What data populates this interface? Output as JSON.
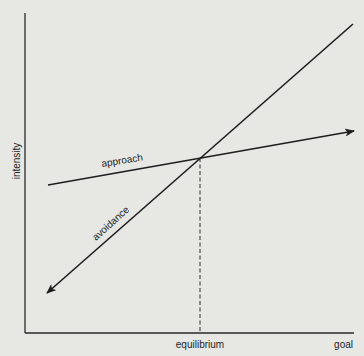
{
  "diagram": {
    "type": "approach-avoidance conflict graph",
    "axes": {
      "y_label": "intensity",
      "x_label": "goal",
      "x_marker_label": "equilibrium"
    },
    "curves": [
      {
        "name": "approach",
        "label": "approach",
        "shape": "shallow rising line with arrow toward goal"
      },
      {
        "name": "avoidance",
        "label": "avoidance",
        "shape": "steep rising line with arrow pointing away from goal"
      }
    ],
    "equilibrium_point": "intersection of approach and avoidance lines, dashed drop line to x-axis",
    "colors": {
      "background": "#e7e7e4",
      "ink": "#1e1e1e"
    }
  }
}
